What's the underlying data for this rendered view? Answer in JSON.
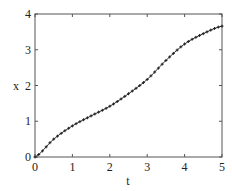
{
  "chart_data": {
    "type": "line",
    "title": "",
    "xlabel": "t",
    "ylabel": "x",
    "xlim": [
      0,
      5
    ],
    "ylim": [
      0,
      4
    ],
    "xticks": [
      0,
      1,
      2,
      3,
      4,
      5
    ],
    "yticks": [
      0,
      1,
      2,
      3,
      4
    ],
    "grid": false,
    "legend": null,
    "marker": "+",
    "line_color": "#333333",
    "series": [
      {
        "name": "x(t)",
        "x": [
          0,
          0.5,
          1.0,
          1.5,
          2.0,
          2.5,
          3.0,
          3.5,
          4.0,
          4.5,
          5.0
        ],
        "values": [
          0.0,
          0.5,
          0.87,
          1.15,
          1.42,
          1.77,
          2.17,
          2.7,
          3.16,
          3.45,
          3.66
        ]
      }
    ]
  }
}
